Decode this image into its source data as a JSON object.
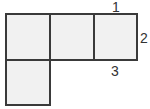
{
  "diagram": {
    "fill_color": "#f1f1f1",
    "stroke_color": "#3a3a3a",
    "labels": {
      "top": "1",
      "right": "2",
      "bottom": "3"
    }
  }
}
